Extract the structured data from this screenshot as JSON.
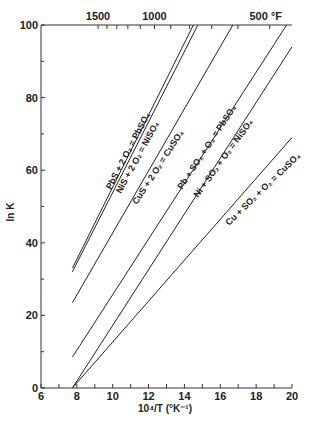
{
  "chart_data": {
    "type": "line",
    "title": "",
    "xlabel": "10^4/T (°K^-1)",
    "ylabel": "ln K",
    "xlim": [
      6,
      20
    ],
    "ylim": [
      0,
      100
    ],
    "grid": false,
    "x_ticks": [
      6,
      8,
      10,
      12,
      14,
      16,
      18,
      20
    ],
    "y_ticks": [
      0,
      20,
      40,
      60,
      80,
      100
    ],
    "top_axis": {
      "unit": "°F",
      "labeled_ticks": [
        {
          "label": "1500",
          "x": 9.18
        },
        {
          "label": "1000",
          "x": 12.33
        },
        {
          "label": "500 °F",
          "x": 18.76
        }
      ],
      "minor_ticks_F": [
        1400,
        1300,
        1200,
        1100,
        900,
        800,
        700,
        600,
        400
      ]
    },
    "series": [
      {
        "name": "PbS + 2 O2 = PbSO4",
        "x": [
          7.75,
          14.5
        ],
        "y": [
          33,
          100
        ]
      },
      {
        "name": "NiS + 2 O2 = NiSO4",
        "x": [
          7.75,
          14.75
        ],
        "y": [
          32,
          100
        ]
      },
      {
        "name": "CuS + 2 O2 = CuSO4",
        "x": [
          7.75,
          16.7
        ],
        "y": [
          23.5,
          100
        ]
      },
      {
        "name": "Pb + SO2 + O2 = PbSO4",
        "x": [
          7.75,
          19.7
        ],
        "y": [
          8.5,
          100
        ]
      },
      {
        "name": "Ni + SO2 + O2 = NiSO4",
        "x": [
          7.75,
          20
        ],
        "y": [
          0,
          94
        ]
      },
      {
        "name": "Cu + SO2 + O2 = CuSO4",
        "x": [
          7.75,
          20
        ],
        "y": [
          0,
          69
        ]
      }
    ]
  },
  "labels": {
    "xlabel": "10⁴/T (°K⁻¹)",
    "ylabel": "ln K",
    "pbs": "PbS + 2 O₂ = PbSO₄",
    "nis": "NiS + 2 O₂ = NiSO₄",
    "cus": "CuS + 2 O₂ = CuSO₄",
    "pb": "Pb + SO₂ + O₂ = PbSO₄",
    "ni": "Ni + SO₂ + O₂ = NiSO₄",
    "cu": "Cu + SO₂ + O₂ = CuSO₄"
  }
}
